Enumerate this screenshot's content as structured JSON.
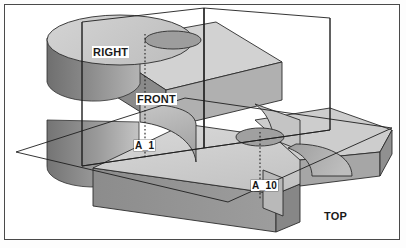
{
  "viewport": {
    "name": "cad-isometric-viewport",
    "width": 406,
    "height": 248,
    "background_color": "#ffffff",
    "frame_color": "#4a4a4a"
  },
  "model": {
    "description": "Isometric shaded solid model of a stepped bracket with cylindrical bosses and through holes",
    "shading": {
      "top_face_color": "#c9c9c9",
      "top_face_highlight": "#d8d8d8",
      "front_face_color": "#8f8f8f",
      "side_face_color": "#a8a8a8",
      "dark_face_color": "#7d7d7d",
      "cylinder_dark_color": "#7a7a7a",
      "cylinder_light_color": "#bdbdbd",
      "edge_color": "#2b2b2b",
      "hole_fill_color": "#9a9a9a"
    }
  },
  "datum_planes": [
    {
      "id": "plane-right",
      "label": "RIGHT"
    },
    {
      "id": "plane-front",
      "label": "FRONT"
    },
    {
      "id": "plane-top",
      "label": "TOP"
    }
  ],
  "datum_axes": [
    {
      "id": "axis-a1",
      "label": "A_1",
      "style": "dotted"
    },
    {
      "id": "axis-a10",
      "label": "A_10",
      "style": "dotted"
    }
  ],
  "annotation_style": {
    "label_background": "#ffffff",
    "label_text_color": "#141414",
    "axis_line_color": "#1f1f1f"
  }
}
